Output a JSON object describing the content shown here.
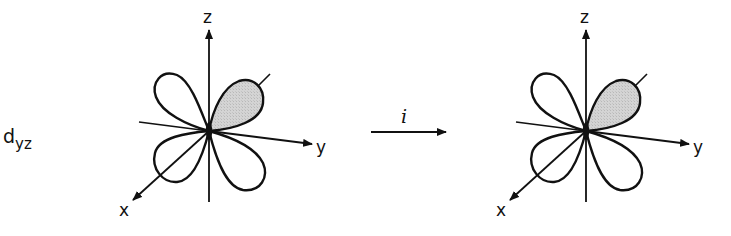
{
  "figure": {
    "orbital_label": {
      "main": "d",
      "subscript": "yz"
    },
    "operation": {
      "symbol": "i",
      "description": "inversion operation arrow"
    },
    "diagrams": [
      {
        "id": "before",
        "origin": [
          209,
          131
        ],
        "axes": {
          "x": "x",
          "y": "y",
          "z": "z"
        },
        "shaded_lobe": "upper-right (+y,+z)"
      },
      {
        "id": "after",
        "origin": [
          586,
          131
        ],
        "axes": {
          "x": "x",
          "y": "y",
          "z": "z"
        },
        "shaded_lobe": "upper-right (+y,+z)"
      }
    ],
    "colors": {
      "stroke": "#111111",
      "shade": "#d0d0d0",
      "background": "#ffffff"
    }
  }
}
